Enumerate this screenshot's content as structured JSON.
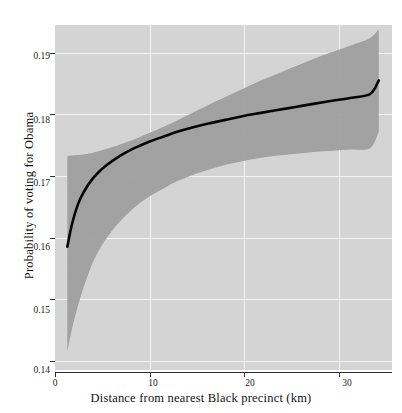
{
  "chart_data": {
    "type": "line",
    "title": "",
    "subtitle": "",
    "xlabel": "Distance from nearest Black precinct (km)",
    "ylabel": "Probability of voting for Obama",
    "xlim": [
      0,
      35.6
    ],
    "ylim": [
      0.1385,
      0.1945
    ],
    "grid": true,
    "legend": null,
    "xticks": [
      0,
      10,
      20,
      30
    ],
    "xtick_labels": [
      "0",
      "10",
      "20",
      "30"
    ],
    "yticks": [
      0.14,
      0.15,
      0.16,
      0.17,
      0.18,
      0.19
    ],
    "ytick_labels": [
      "0.14",
      "0.15",
      "0.16",
      "0.17",
      "0.18",
      "0.19"
    ],
    "series": [
      {
        "name": "fitted probability",
        "kind": "line",
        "color": "#000000",
        "x": [
          1.3,
          1.8,
          2.4,
          3.0,
          3.8,
          4.6,
          5.5,
          6.5,
          7.6,
          8.8,
          10.0,
          11.5,
          13.0,
          14.6,
          16.2,
          18.0,
          19.8,
          21.6,
          23.5,
          25.4,
          27.3,
          29.3,
          31.3,
          33.3,
          34.2
        ],
        "y": [
          0.1585,
          0.1622,
          0.1653,
          0.1673,
          0.1692,
          0.1706,
          0.1718,
          0.1729,
          0.1739,
          0.1748,
          0.1756,
          0.1764,
          0.1772,
          0.1779,
          0.1785,
          0.1791,
          0.1797,
          0.1802,
          0.1807,
          0.1812,
          0.1817,
          0.1822,
          0.1827,
          0.1833,
          0.1855
        ]
      },
      {
        "name": "confidence band",
        "kind": "ribbon",
        "color": "#9a9a9a",
        "x": [
          1.3,
          1.8,
          2.4,
          3.0,
          3.8,
          4.6,
          5.5,
          6.5,
          7.6,
          8.8,
          10.0,
          11.5,
          13.0,
          14.6,
          16.2,
          18.0,
          19.8,
          21.6,
          23.5,
          25.4,
          27.3,
          29.3,
          31.3,
          33.3,
          34.2
        ],
        "ylower": [
          0.1415,
          0.1452,
          0.1488,
          0.1518,
          0.1552,
          0.1578,
          0.16,
          0.162,
          0.1638,
          0.1654,
          0.1667,
          0.168,
          0.1692,
          0.1702,
          0.171,
          0.1718,
          0.1724,
          0.1729,
          0.1733,
          0.1736,
          0.1739,
          0.1741,
          0.1743,
          0.1745,
          0.1772
        ],
        "yupper": [
          0.1732,
          0.1733,
          0.1734,
          0.1735,
          0.1737,
          0.174,
          0.1744,
          0.1749,
          0.1755,
          0.1762,
          0.177,
          0.178,
          0.1791,
          0.1803,
          0.1815,
          0.1828,
          0.1841,
          0.1854,
          0.1866,
          0.1878,
          0.189,
          0.1901,
          0.1912,
          0.1924,
          0.1938
        ]
      }
    ],
    "colors": {
      "panel_background": "#d4d4d4",
      "gridline": "#f2f2f2",
      "ribbon": "#9e9e9e",
      "line": "#050505",
      "text": "#1b1b1b",
      "axis": "#3a3a3a",
      "figure_background": "#ffffff"
    }
  },
  "axes": {
    "x_title": "Distance from nearest Black precinct (km)",
    "y_title": "Probability of voting for Obama",
    "x_ticks": [
      {
        "value": 0,
        "label": "0"
      },
      {
        "value": 10,
        "label": "10"
      },
      {
        "value": 20,
        "label": "20"
      },
      {
        "value": 30,
        "label": "30"
      }
    ],
    "y_ticks": [
      {
        "value": 0.14,
        "label": "0.14"
      },
      {
        "value": 0.15,
        "label": "0.15"
      },
      {
        "value": 0.16,
        "label": "0.16"
      },
      {
        "value": 0.17,
        "label": "0.17"
      },
      {
        "value": 0.18,
        "label": "0.18"
      },
      {
        "value": 0.19,
        "label": "0.19"
      }
    ]
  }
}
